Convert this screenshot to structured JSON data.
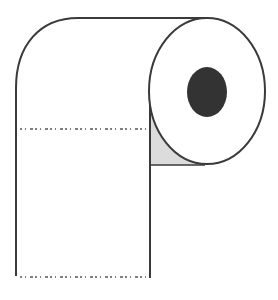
{
  "image": {
    "subject": "toilet-paper-roll",
    "colors": {
      "background": "#ffffff",
      "outline": "#3a3a3a",
      "core_hole": "#333333",
      "shadow": "#dcdcdc",
      "perforation": "#555555"
    }
  }
}
